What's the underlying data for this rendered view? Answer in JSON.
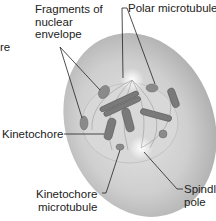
{
  "labels": {
    "truncated": "re",
    "fragments_line1": "Fragments of",
    "fragments_line2": "nuclear",
    "fragments_line3": "envelope",
    "polar": "Polar microtubules",
    "kinetochore": "Kinetochore",
    "kmt_line1": "Kinetochore",
    "kmt_line2": "microtubule",
    "spindle_line1": "Spindle",
    "spindle_line2": "pole"
  },
  "colors": {
    "cell_fill": "#c9c9c9",
    "cell_edge": "#a8a8a8",
    "chromosome": "#7a7a7a",
    "leader_line": "#222222"
  }
}
